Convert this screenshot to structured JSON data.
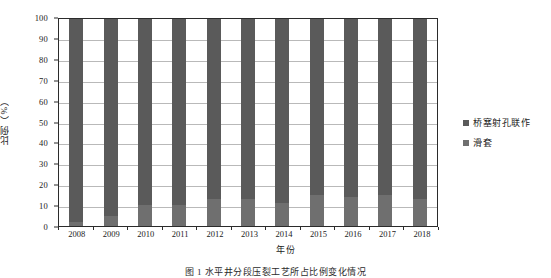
{
  "chart_data": {
    "type": "bar",
    "stacked": true,
    "stack_mode": "percent",
    "title": "",
    "xlabel": "年份",
    "ylabel": "比例（%）",
    "categories": [
      "2008",
      "2009",
      "2010",
      "2011",
      "2012",
      "2013",
      "2014",
      "2015",
      "2016",
      "2017",
      "2018"
    ],
    "series": [
      {
        "name": "桥塞射孔联作",
        "color": "#5a5a5a",
        "values": [
          98,
          95,
          90,
          90,
          87,
          87,
          89,
          85,
          86,
          85,
          87
        ]
      },
      {
        "name": "滑套",
        "color": "#6f6f6f",
        "values": [
          2,
          5,
          10,
          10,
          13,
          13,
          11,
          15,
          14,
          15,
          13
        ]
      }
    ],
    "ylim": [
      0,
      100
    ],
    "ytick_step": 10,
    "yticks": [
      "0",
      "10",
      "20",
      "30",
      "40",
      "50",
      "60",
      "70",
      "80",
      "90",
      "100"
    ],
    "grid": "horizontal",
    "legend_position": "right"
  },
  "legend": {
    "items": [
      {
        "label": "桥塞射孔联作",
        "color": "#5a5a5a"
      },
      {
        "label": "滑套",
        "color": "#6f6f6f"
      }
    ]
  },
  "axes": {
    "y_title": "比例（%）",
    "x_title": "年份"
  },
  "caption": "图 1   水平井分段压裂工艺所占比例变化情况"
}
